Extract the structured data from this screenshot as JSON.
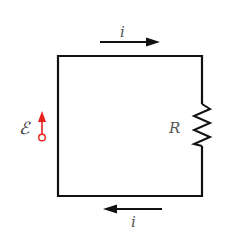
{
  "diagram": {
    "type": "circuit",
    "title": "",
    "labels": {
      "current_top": "i",
      "current_bottom": "i",
      "resistor": "R",
      "emf": "ℰ"
    },
    "components": [
      {
        "kind": "emf_source",
        "label": "ℰ",
        "position": "left side",
        "direction": "up"
      },
      {
        "kind": "resistor",
        "label": "R",
        "position": "right side"
      }
    ],
    "currents": [
      {
        "label": "i",
        "position": "top",
        "direction": "right"
      },
      {
        "label": "i",
        "position": "bottom",
        "direction": "left"
      }
    ],
    "colors": {
      "wire": "#111111",
      "emf_arrow": "#e8201c",
      "text": "#555555"
    }
  }
}
